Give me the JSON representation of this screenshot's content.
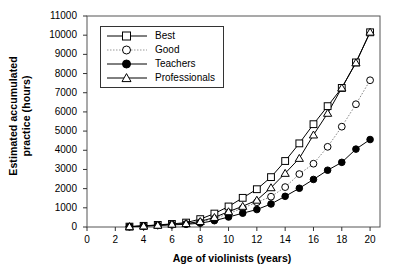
{
  "chart_data": {
    "type": "line",
    "title": "",
    "xlabel": "Age of violinists (years)",
    "ylabel": "Estimated accumulated practice (hours)",
    "ylabel_line1": "Estimated accumulated",
    "ylabel_line2": "practice (hours)",
    "xlim": [
      0,
      20.7
    ],
    "ylim": [
      0,
      11000
    ],
    "xticks": [
      0,
      2,
      4,
      6,
      8,
      10,
      12,
      14,
      16,
      18,
      20
    ],
    "xtick_labels": [
      "0",
      "2",
      "4",
      "6",
      "8",
      "10",
      "12",
      "14",
      "16",
      "18",
      "20"
    ],
    "yticks": [
      0,
      1000,
      2000,
      3000,
      4000,
      5000,
      6000,
      7000,
      8000,
      9000,
      10000,
      11000
    ],
    "ytick_labels": [
      "0",
      "1000",
      "2000",
      "3000",
      "4000",
      "5000",
      "6000",
      "7000",
      "8000",
      "9000",
      "10000",
      "11000"
    ],
    "grid": false,
    "legend_position": "upper left",
    "x": [
      3,
      4,
      5,
      6,
      7,
      8,
      9,
      10,
      11,
      12,
      13,
      14,
      15,
      16,
      17,
      18,
      19,
      20
    ],
    "series": [
      {
        "name": "Best",
        "marker": "open-square",
        "line": "solid",
        "color": "#000000",
        "values": [
          20,
          60,
          110,
          160,
          230,
          410,
          700,
          1070,
          1520,
          1970,
          2600,
          3440,
          4360,
          5360,
          6300,
          7250,
          8580,
          10150
        ]
      },
      {
        "name": "Good",
        "marker": "open-circle",
        "line": "dotted",
        "color": "#888888",
        "values": [
          20,
          50,
          90,
          140,
          160,
          250,
          430,
          700,
          980,
          1290,
          1580,
          2080,
          2760,
          3300,
          4180,
          5230,
          6400,
          7650
        ]
      },
      {
        "name": "Teachers",
        "marker": "filled-circle",
        "line": "solid",
        "color": "#000000",
        "values": [
          20,
          45,
          75,
          110,
          140,
          200,
          330,
          520,
          720,
          910,
          1200,
          1600,
          2020,
          2480,
          2960,
          3370,
          4060,
          4560
        ]
      },
      {
        "name": "Professionals",
        "marker": "open-triangle",
        "line": "solid",
        "color": "#000000",
        "values": [
          20,
          55,
          95,
          150,
          180,
          290,
          500,
          800,
          1080,
          1400,
          2050,
          2800,
          3580,
          4800,
          5930,
          7250,
          8560,
          10160
        ]
      }
    ]
  },
  "legend": {
    "items": [
      {
        "label": "Best"
      },
      {
        "label": "Good"
      },
      {
        "label": "Teachers"
      },
      {
        "label": "Professionals"
      }
    ]
  }
}
